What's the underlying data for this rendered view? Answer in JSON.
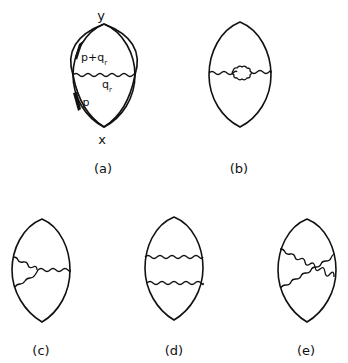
{
  "figure": {
    "panels": [
      {
        "id": "a",
        "caption": "(a)",
        "vertices": {
          "top": "y",
          "bottom": "x"
        },
        "momenta": {
          "upper": "p+q",
          "upper_sub": "r",
          "photon": "q",
          "photon_sub": "r",
          "lower": "p"
        },
        "photon_lines": [
          "horizontal"
        ]
      },
      {
        "id": "b",
        "caption": "(b)",
        "photon_lines": [
          "horizontal with self-energy loop"
        ]
      },
      {
        "id": "c",
        "caption": "(c)",
        "photon_lines": [
          "vertex correction (fork)"
        ]
      },
      {
        "id": "d",
        "caption": "(d)",
        "photon_lines": [
          "ladder upper",
          "ladder lower"
        ]
      },
      {
        "id": "e",
        "caption": "(e)",
        "photon_lines": [
          "crossed",
          "crossed"
        ]
      }
    ],
    "colors": {
      "ink": "#111111",
      "background": "#ffffff"
    }
  }
}
